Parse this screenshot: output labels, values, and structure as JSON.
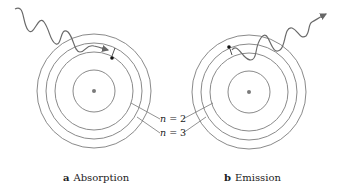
{
  "panels": [
    {
      "id": "a",
      "letter": "a",
      "title": "Absorption",
      "photon": "incoming photon absorbed",
      "electron_transition": "n = 2 to n = 3"
    },
    {
      "id": "b",
      "letter": "b",
      "title": "Emission",
      "photon": "outgoing photon emitted",
      "electron_transition": "n = 3 to n = 2"
    }
  ],
  "labels": {
    "n2": {
      "var": "n",
      "eq": " = 2"
    },
    "n3": {
      "var": "n",
      "eq": " = 3"
    }
  },
  "colors": {
    "orbit": "#8a8a8a",
    "photon": "#6a6a6a",
    "nucleus": "#7a7a7a",
    "electron": "#111111"
  }
}
